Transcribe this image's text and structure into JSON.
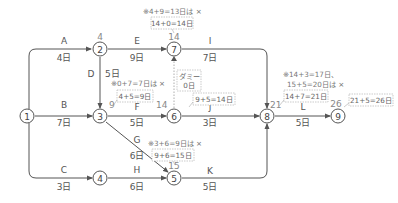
{
  "diagram": {
    "type": "arrow-network-schedule",
    "nodes": [
      {
        "id": "1",
        "label": "1",
        "earliest": ""
      },
      {
        "id": "2",
        "label": "2",
        "earliest": "4"
      },
      {
        "id": "3",
        "label": "3",
        "earliest": "9"
      },
      {
        "id": "4",
        "label": "4",
        "earliest": ""
      },
      {
        "id": "5",
        "label": "5",
        "earliest": "15"
      },
      {
        "id": "6",
        "label": "6",
        "earliest": "14"
      },
      {
        "id": "7",
        "label": "7",
        "earliest": "14"
      },
      {
        "id": "8",
        "label": "8",
        "earliest": "21"
      },
      {
        "id": "9",
        "label": "9",
        "earliest": "26"
      }
    ],
    "activities": [
      {
        "name": "A",
        "from": "1",
        "to": "2",
        "duration": "4日"
      },
      {
        "name": "B",
        "from": "1",
        "to": "3",
        "duration": "7日"
      },
      {
        "name": "C",
        "from": "1",
        "to": "4",
        "duration": "3日"
      },
      {
        "name": "D",
        "from": "2",
        "to": "3",
        "duration": "5日"
      },
      {
        "name": "E",
        "from": "2",
        "to": "7",
        "duration": "9日"
      },
      {
        "name": "F",
        "from": "3",
        "to": "6",
        "duration": "5日"
      },
      {
        "name": "G",
        "from": "3",
        "to": "5",
        "duration": "6日"
      },
      {
        "name": "H",
        "from": "4",
        "to": "5",
        "duration": "6日"
      },
      {
        "name": "I",
        "from": "7",
        "to": "8",
        "duration": "7日"
      },
      {
        "name": "J",
        "from": "6",
        "to": "8",
        "duration": "3日"
      },
      {
        "name": "K",
        "from": "5",
        "to": "8",
        "duration": "5日"
      },
      {
        "name": "L",
        "from": "8",
        "to": "9",
        "duration": "5日"
      },
      {
        "name": "ダミー",
        "from": "6",
        "to": "7",
        "duration": "0日",
        "dummy": true
      }
    ],
    "notes": {
      "n7": {
        "note": "※4+9=13日は ×",
        "box": "14+0=14日"
      },
      "n3": {
        "note": "※0+7=7日は ×",
        "box": "4+5=9日"
      },
      "n6": {
        "box": "9+5=14日"
      },
      "n5": {
        "note": "※3+6=9日は ×",
        "box": "9+6=15日"
      },
      "n8": {
        "note1": "※14+3=17日、",
        "note2": "15+5=20日は ×",
        "box": "14+7=21日"
      },
      "n9": {
        "box": "21+5=26日"
      }
    }
  }
}
